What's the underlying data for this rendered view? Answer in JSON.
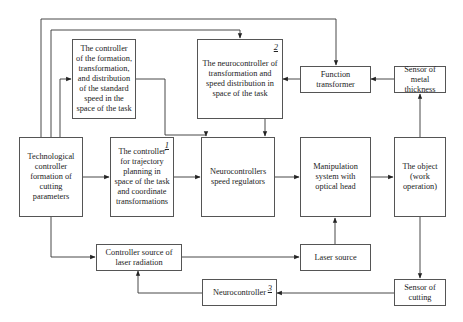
{
  "diagram": {
    "type": "block-diagram",
    "blocks": {
      "formation_controller": {
        "label": "The controller of the formation, transformation, and distribution of the standard speed in the space of the task"
      },
      "neuro_transform": {
        "label": "The neurocontroller of transformation and speed distribution in space of the task",
        "number": "2"
      },
      "function_transformer": {
        "label": "Function transformer"
      },
      "sensor_metal": {
        "label": "Sensor of metal thickness"
      },
      "tech_controller": {
        "label": "Technological controller formation of cutting parameters"
      },
      "trajectory_controller": {
        "label": "The controller for trajectory planning in space of the task and coordinate transformations",
        "number": "1"
      },
      "neuro_speed": {
        "label": "Neurocontrollers speed regulators"
      },
      "manipulation": {
        "label": "Manipulation system with optical head"
      },
      "object": {
        "label": "The object (work operation)"
      },
      "laser_controller": {
        "label": "Controller source of laser radiation"
      },
      "laser_source": {
        "label": "Laser source"
      },
      "neurocontroller": {
        "label": "Neurocontroller",
        "number": "3"
      },
      "sensor_cutting": {
        "label": "Sensor of cutting"
      }
    },
    "connections": [
      {
        "from": "tech_controller",
        "to": "function_transformer"
      },
      {
        "from": "tech_controller",
        "to": "neuro_transform"
      },
      {
        "from": "tech_controller",
        "to": "formation_controller"
      },
      {
        "from": "formation_controller",
        "to": "neuro_speed"
      },
      {
        "from": "neuro_transform",
        "to": "neuro_speed"
      },
      {
        "from": "function_transformer",
        "to": "neuro_transform"
      },
      {
        "from": "sensor_metal",
        "to": "function_transformer"
      },
      {
        "from": "object",
        "to": "sensor_metal"
      },
      {
        "from": "tech_controller",
        "to": "trajectory_controller"
      },
      {
        "from": "trajectory_controller",
        "to": "neuro_speed"
      },
      {
        "from": "neuro_speed",
        "to": "manipulation"
      },
      {
        "from": "manipulation",
        "to": "object"
      },
      {
        "from": "tech_controller",
        "to": "laser_controller"
      },
      {
        "from": "laser_controller",
        "to": "laser_source"
      },
      {
        "from": "laser_source",
        "to": "manipulation"
      },
      {
        "from": "object",
        "to": "sensor_cutting"
      },
      {
        "from": "sensor_cutting",
        "to": "neurocontroller"
      },
      {
        "from": "neurocontroller",
        "to": "laser_controller"
      }
    ]
  }
}
